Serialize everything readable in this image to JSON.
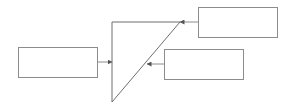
{
  "diagram": {
    "stroke_color": "#8c8c8c",
    "background": "#ffffff",
    "boxes": [
      {
        "id": "left-box",
        "label": "",
        "x": 18,
        "y": 47,
        "w": 80,
        "h": 31
      },
      {
        "id": "top-right-box",
        "label": "",
        "x": 198,
        "y": 7,
        "w": 80,
        "h": 31
      },
      {
        "id": "middle-right-box",
        "label": "",
        "x": 164,
        "y": 49,
        "w": 80,
        "h": 31
      }
    ],
    "triangle": {
      "points": "112,22 180,22 112,102"
    },
    "arrows": [
      {
        "from": "left-box",
        "to": "triangle-left-edge",
        "x1": 98,
        "y1": 62,
        "x2": 112,
        "y2": 62
      },
      {
        "from": "top-right-box",
        "to": "triangle-top-right-corner",
        "x1": 198,
        "y1": 22,
        "x2": 180,
        "y2": 22
      },
      {
        "from": "middle-right-box",
        "to": "triangle-hypotenuse",
        "x1": 164,
        "y1": 64,
        "x2": 147,
        "y2": 64
      }
    ]
  }
}
